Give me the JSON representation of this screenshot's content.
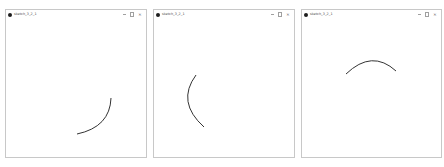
{
  "windows": [
    {
      "title": "sketch_3_2_1",
      "controls": {
        "minimize": "—",
        "maximize": "☐",
        "close": "✕"
      },
      "arc": {
        "description": "quarter arc lower-right, curving from top-right down to bottom-left",
        "path": "M 105 79 Q 104 108 71 115",
        "stroke": "#333333"
      }
    },
    {
      "title": "sketch_3_2_1",
      "controls": {
        "minimize": "—",
        "maximize": "☐",
        "close": "✕"
      },
      "arc": {
        "description": "arc bulging left, from top down to bottom-right",
        "path": "M 42 56 Q 22 83 50 108",
        "stroke": "#333333"
      }
    },
    {
      "title": "sketch_3_2_1",
      "controls": {
        "minimize": "—",
        "maximize": "☐",
        "close": "✕"
      },
      "arc": {
        "description": "arc bulging upward, from left rising to peak then descending right",
        "path": "M 44 55 Q 70 30 94 52",
        "stroke": "#333333"
      }
    }
  ]
}
